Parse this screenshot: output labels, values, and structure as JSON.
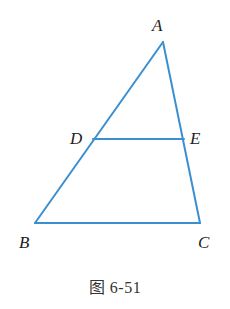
{
  "figure": {
    "caption": "图 6-51",
    "line_color": "#3a8fd1",
    "label_color": "#222222"
  },
  "points": {
    "A": {
      "label": "A",
      "x": 163,
      "y": 42,
      "label_x": 152,
      "label_y": 31
    },
    "B": {
      "label": "B",
      "x": 35,
      "y": 223,
      "label_x": 19,
      "label_y": 248
    },
    "C": {
      "label": "C",
      "x": 200,
      "y": 223,
      "label_x": 198,
      "label_y": 248
    },
    "D": {
      "label": "D",
      "x": 93,
      "y": 139,
      "label_x": 70,
      "label_y": 144
    },
    "E": {
      "label": "E",
      "x": 184,
      "y": 139,
      "label_x": 190,
      "label_y": 144
    }
  },
  "segments": [
    {
      "name": "segment-AB",
      "from": "A",
      "to": "B"
    },
    {
      "name": "segment-AC",
      "from": "A",
      "to": "C"
    },
    {
      "name": "segment-BC",
      "from": "B",
      "to": "C"
    },
    {
      "name": "segment-DE",
      "from": "D",
      "to": "E"
    }
  ]
}
